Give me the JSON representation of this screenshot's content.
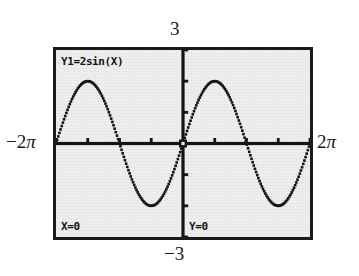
{
  "device": {
    "kind": "graphing-calculator-screen",
    "screen_bg": "#efefef",
    "ink": "#141414",
    "page_bg": "#ffffff"
  },
  "screen": {
    "equation_label": "Y1=2sin(X)",
    "x_readout": "X=0",
    "y_readout": "Y=0"
  },
  "annotations": {
    "y_max": "3",
    "y_min": "−3",
    "x_min_sign": "−2",
    "x_min_pi": "π",
    "x_max_sign": "2",
    "x_max_pi": "π"
  },
  "chart_data": {
    "type": "line",
    "title": "",
    "subtitle": "",
    "xlabel": "",
    "ylabel": "",
    "function": "y = 2 sin(x)",
    "series": [
      {
        "name": "Y1=2sin(X)",
        "expression": "2*sin(x)",
        "amplitude": 2,
        "period": 6.283185307179586,
        "style": "dotted-pixel-trace",
        "color": "#141414"
      }
    ],
    "xlim": [
      -6.283185307179586,
      6.283185307179586
    ],
    "ylim": [
      -3,
      3
    ],
    "xtick_step": 1.5707963267948966,
    "ytick_step": 1,
    "xtick_labels": [
      "−2π",
      "",
      "",
      "",
      "0",
      "",
      "",
      "",
      "2π"
    ],
    "ytick_labels": [
      "−3",
      "",
      "",
      "0",
      "",
      "",
      "3"
    ],
    "grid": false,
    "axes_visible": true,
    "legend": "none",
    "cursor": {
      "x": 0,
      "y": 0,
      "visible": true
    },
    "key_points": [
      {
        "x": -6.283185307179586,
        "y": 0
      },
      {
        "x": -4.71238898038469,
        "y": 2
      },
      {
        "x": -3.141592653589793,
        "y": 0
      },
      {
        "x": -1.570796326794897,
        "y": -2
      },
      {
        "x": 0,
        "y": 0
      },
      {
        "x": 1.570796326794897,
        "y": 2
      },
      {
        "x": 3.141592653589793,
        "y": 0
      },
      {
        "x": 4.71238898038469,
        "y": -2
      },
      {
        "x": 6.283185307179586,
        "y": 0
      }
    ]
  }
}
